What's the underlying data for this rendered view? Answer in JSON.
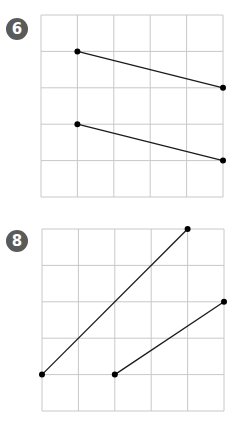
{
  "puzzles": [
    {
      "number": "6",
      "badge_color": "#5a5a5a",
      "grid": {
        "cols": 5,
        "rows": 5
      },
      "segments": [
        {
          "from": [
            1,
            1
          ],
          "to": [
            5,
            2
          ]
        },
        {
          "from": [
            1,
            3
          ],
          "to": [
            5,
            4
          ]
        }
      ]
    },
    {
      "number": "8",
      "badge_color": "#5a5a5a",
      "grid": {
        "cols": 5,
        "rows": 5
      },
      "segments": [
        {
          "from": [
            0,
            4
          ],
          "to": [
            4,
            0
          ]
        },
        {
          "from": [
            2,
            4
          ],
          "to": [
            5,
            2
          ]
        }
      ]
    }
  ],
  "style": {
    "grid_color": "#c8c8c8",
    "line_color": "#1a1a1a",
    "dot_color": "#000000"
  }
}
